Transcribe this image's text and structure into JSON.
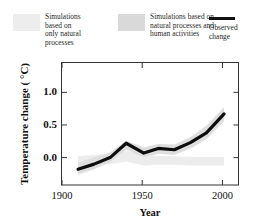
{
  "legend": {
    "entries": [
      {
        "id": "natural-only",
        "swatch": "light-gray-band",
        "label": "Simulations\nbased on\nonly natural\nprocesses"
      },
      {
        "id": "natural-human",
        "swatch": "gray-band",
        "label": "Simulations based on\nnatural processes and\nhuman activities"
      },
      {
        "id": "observed",
        "swatch": "black-line",
        "label": "Observed\nchange"
      }
    ]
  },
  "chart_data": {
    "type": "line",
    "title": "",
    "xlabel": "Year",
    "ylabel": "Temperature change ( °C)",
    "xlim": [
      1900,
      2010
    ],
    "ylim": [
      -0.42,
      1.45
    ],
    "xticks": [
      1900,
      1950,
      2000
    ],
    "xtick_labels": [
      "1900",
      "1950",
      "2000"
    ],
    "yticks": [
      0.0,
      0.5,
      1.0
    ],
    "ytick_labels": [
      "0.0",
      "0.5",
      "1.0"
    ],
    "grid": false,
    "legend_position": "above-plot",
    "series": [
      {
        "name": "Observed change",
        "type": "line",
        "color": "#0d0d0d",
        "x": [
          1910,
          1920,
          1930,
          1940,
          1951,
          1960,
          1970,
          1980,
          1990,
          2001
        ],
        "values": [
          -0.18,
          -0.1,
          0.0,
          0.22,
          0.07,
          0.14,
          0.12,
          0.23,
          0.38,
          0.67
        ]
      },
      {
        "name": "Simulations based on natural processes and human activities",
        "type": "band",
        "color": "#dedede",
        "x": [
          1910,
          1920,
          1930,
          1940,
          1951,
          1960,
          1970,
          1980,
          1990,
          2001
        ],
        "upper": [
          -0.08,
          0.0,
          0.08,
          0.26,
          0.16,
          0.21,
          0.2,
          0.31,
          0.49,
          0.77
        ],
        "lower": [
          -0.26,
          -0.18,
          -0.07,
          0.12,
          0.0,
          0.06,
          0.04,
          0.14,
          0.28,
          0.56
        ]
      },
      {
        "name": "Simulations based on only natural processes",
        "type": "band",
        "color": "#ececec",
        "x": [
          1910,
          1920,
          1930,
          1940,
          1951,
          1960,
          1970,
          1980,
          1990,
          2001
        ],
        "upper": [
          0.02,
          0.04,
          0.06,
          0.1,
          0.04,
          0.03,
          0.02,
          0.01,
          0.01,
          0.01
        ],
        "lower": [
          -0.14,
          -0.12,
          -0.1,
          -0.06,
          -0.12,
          -0.11,
          -0.11,
          -0.12,
          -0.12,
          -0.12
        ]
      }
    ]
  }
}
